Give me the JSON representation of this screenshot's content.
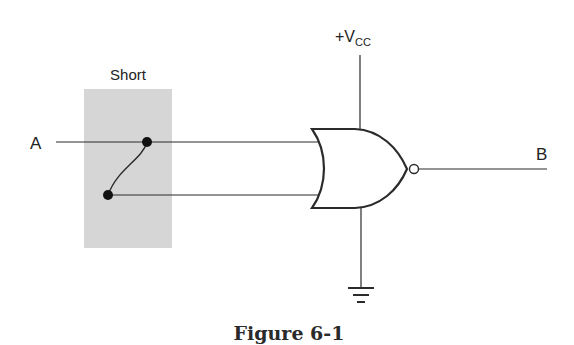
{
  "diagram": {
    "type": "logic-circuit",
    "gate": "NOR",
    "labels": {
      "input": "A",
      "output": "B",
      "supply_prefix": "+V",
      "supply_sub": "CC",
      "short_box": "Short"
    },
    "caption": "Figure 6-1",
    "colors": {
      "line": "#2b2b2b",
      "short_fill": "#d6d6d6",
      "background": "#ffffff"
    },
    "components": [
      {
        "id": "input-A",
        "kind": "wire",
        "label": "A"
      },
      {
        "id": "short",
        "kind": "fault-box",
        "label": "Short",
        "description": "Both NOR inputs shorted together"
      },
      {
        "id": "nor-gate",
        "kind": "gate",
        "label": "NOR"
      },
      {
        "id": "vcc",
        "kind": "power",
        "label": "+Vcc"
      },
      {
        "id": "ground",
        "kind": "ground"
      },
      {
        "id": "output-B",
        "kind": "wire",
        "label": "B"
      }
    ]
  }
}
